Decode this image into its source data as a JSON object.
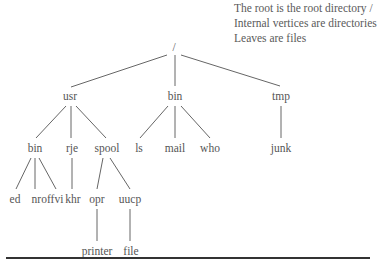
{
  "legend": {
    "lines": [
      "The root is the root directory /",
      "Internal vertices are directories",
      "Leaves are files"
    ]
  },
  "tree": {
    "nodes": [
      {
        "id": "root",
        "label": "/",
        "x": 174,
        "y": 47
      },
      {
        "id": "usr",
        "label": "usr",
        "x": 70,
        "y": 96
      },
      {
        "id": "bin1",
        "label": "bin",
        "x": 175,
        "y": 96
      },
      {
        "id": "tmp",
        "label": "tmp",
        "x": 281,
        "y": 96
      },
      {
        "id": "bin2",
        "label": "bin",
        "x": 35,
        "y": 148
      },
      {
        "id": "rje",
        "label": "rje",
        "x": 72,
        "y": 148
      },
      {
        "id": "spool",
        "label": "spool",
        "x": 107,
        "y": 148
      },
      {
        "id": "ls",
        "label": "ls",
        "x": 139,
        "y": 148
      },
      {
        "id": "mail",
        "label": "mail",
        "x": 175,
        "y": 148
      },
      {
        "id": "who",
        "label": "who",
        "x": 210,
        "y": 148
      },
      {
        "id": "junk",
        "label": "junk",
        "x": 281,
        "y": 148
      },
      {
        "id": "ed",
        "label": "ed",
        "x": 15,
        "y": 199
      },
      {
        "id": "nroff",
        "label": "nroff",
        "x": 43,
        "y": 199
      },
      {
        "id": "vi",
        "label": "vi",
        "x": 59,
        "y": 199
      },
      {
        "id": "khr",
        "label": "khr",
        "x": 73,
        "y": 199
      },
      {
        "id": "opr",
        "label": "opr",
        "x": 97,
        "y": 199
      },
      {
        "id": "uucp",
        "label": "uucp",
        "x": 130,
        "y": 199
      },
      {
        "id": "printer",
        "label": "printer",
        "x": 97,
        "y": 251
      },
      {
        "id": "file",
        "label": "file",
        "x": 131,
        "y": 251
      }
    ],
    "edges": [
      [
        167,
        55,
        71,
        87
      ],
      [
        175,
        55,
        175,
        86
      ],
      [
        181,
        55,
        280,
        86
      ],
      [
        66,
        106,
        36,
        138
      ],
      [
        71,
        106,
        71,
        138
      ],
      [
        76,
        106,
        106,
        138
      ],
      [
        168,
        106,
        140,
        138
      ],
      [
        175,
        106,
        175,
        138
      ],
      [
        181,
        106,
        210,
        138
      ],
      [
        281,
        106,
        281,
        138
      ],
      [
        31,
        158,
        16,
        189
      ],
      [
        35,
        158,
        35,
        189
      ],
      [
        39,
        158,
        56,
        189
      ],
      [
        72,
        158,
        72,
        189
      ],
      [
        103,
        158,
        97,
        189
      ],
      [
        110,
        158,
        130,
        189
      ],
      [
        97,
        209,
        97,
        241
      ],
      [
        130,
        209,
        130,
        241
      ]
    ]
  }
}
